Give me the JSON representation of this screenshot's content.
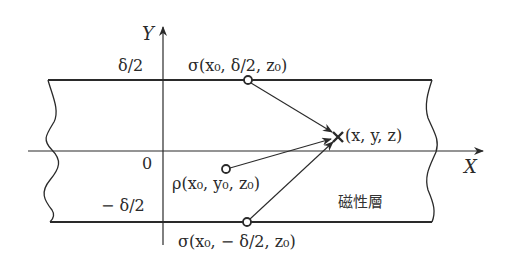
{
  "diagram": {
    "axes": {
      "x_label": "X",
      "y_label": "Y",
      "origin_label": "0"
    },
    "ticks": {
      "top": "δ/2",
      "bottom": "− δ/2"
    },
    "points": {
      "sigma_top": "σ(x₀, δ/2, z₀)",
      "sigma_bottom": "σ(x₀, − δ/2, z₀)",
      "rho": "ρ(x₀, y₀, z₀)",
      "field_point": "(x, y, z)"
    },
    "layer_label": "磁性層",
    "colors": {
      "line": "#2a2a2a",
      "background": "#ffffff"
    }
  }
}
